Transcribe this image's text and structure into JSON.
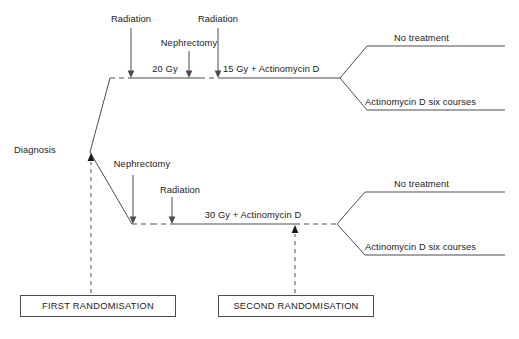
{
  "diagram": {
    "type": "clinical-trial-schema",
    "title": "",
    "colors": {
      "line": "#4d4d4d",
      "text": "#1a1a1a",
      "background": "#ffffff"
    },
    "entry": {
      "label": "Diagnosis"
    },
    "arms": [
      {
        "id": "upper-arm",
        "name": "Preoperative radiation arm",
        "events": [
          {
            "id": "upper-radiation-1",
            "label": "Radiation",
            "kind": "arrow-event"
          },
          {
            "id": "upper-nephrectomy",
            "label": "Nephrectomy",
            "kind": "arrow-event"
          },
          {
            "id": "upper-radiation-2",
            "label": "Radiation",
            "kind": "arrow-event"
          }
        ],
        "segments": [
          {
            "id": "upper-dose-1",
            "label": "20 Gy"
          },
          {
            "id": "upper-dose-2",
            "label": "15 Gy + Actinomycin D"
          }
        ],
        "outcomes": [
          {
            "id": "upper-outcome-no-treatment",
            "label": "No treatment"
          },
          {
            "id": "upper-outcome-actinomycin",
            "label": "Actinomycin D six courses"
          }
        ]
      },
      {
        "id": "lower-arm",
        "name": "Immediate nephrectomy arm",
        "events": [
          {
            "id": "lower-nephrectomy",
            "label": "Nephrectomy",
            "kind": "arrow-event"
          },
          {
            "id": "lower-radiation",
            "label": "Radiation",
            "kind": "arrow-event"
          }
        ],
        "segments": [
          {
            "id": "lower-dose-1",
            "label": "30 Gy + Actinomycin D"
          }
        ],
        "outcomes": [
          {
            "id": "lower-outcome-no-treatment",
            "label": "No treatment"
          },
          {
            "id": "lower-outcome-actinomycin",
            "label": "Actinomycin D six courses"
          }
        ]
      }
    ],
    "randomisations": [
      {
        "id": "first-randomisation",
        "label": "FIRST RANDOMISATION"
      },
      {
        "id": "second-randomisation",
        "label": "SECOND RANDOMISATION"
      }
    ]
  }
}
